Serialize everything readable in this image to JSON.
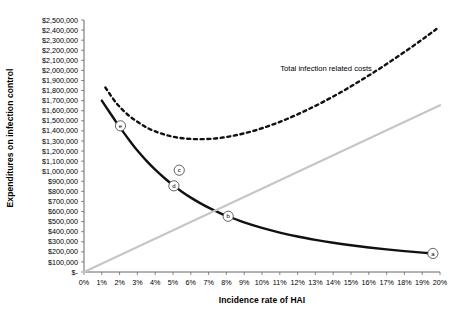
{
  "chart_data": {
    "type": "line",
    "title": "",
    "xlabel": "Incidence rate of HAI",
    "ylabel": "Expenditures on infection control",
    "xlim": [
      0,
      20
    ],
    "ylim": [
      0,
      2500000
    ],
    "grid": false,
    "legend_position": "inline-annotation",
    "x_tick_labels": [
      "0%",
      "1%",
      "2%",
      "3%",
      "4%",
      "5%",
      "6%",
      "7%",
      "8%",
      "9%",
      "10%",
      "11%",
      "12%",
      "13%",
      "14%",
      "15%",
      "16%",
      "17%",
      "18%",
      "19%",
      "20%"
    ],
    "x_tick_values": [
      0,
      1,
      2,
      3,
      4,
      5,
      6,
      7,
      8,
      9,
      10,
      11,
      12,
      13,
      14,
      15,
      16,
      17,
      18,
      19,
      20
    ],
    "y_tick_labels": [
      "$2,500,000",
      "$2,400,000",
      "$2,300,000",
      "$2,200,000",
      "$2,100,000",
      "$2,000,000",
      "$1,900,000",
      "$1,800,000",
      "$1,700,000",
      "$1,600,000",
      "$1,500,000",
      "$1,400,000",
      "$1,300,000",
      "$1,200,000",
      "$1,100,000",
      "$1,000,000",
      "$900,000",
      "$800,000",
      "$700,000",
      "$600,000",
      "$500,000",
      "$400,000",
      "$300,000",
      "$200,000",
      "$100,000",
      "$-"
    ],
    "y_tick_values": [
      2500000,
      2400000,
      2300000,
      2200000,
      2100000,
      2000000,
      1900000,
      1800000,
      1700000,
      1600000,
      1500000,
      1400000,
      1300000,
      1200000,
      1100000,
      1000000,
      900000,
      800000,
      700000,
      600000,
      500000,
      400000,
      300000,
      200000,
      100000,
      0
    ],
    "annotations": [
      {
        "text": "Total infection related costs",
        "x": 13.6,
        "y": 1990000
      }
    ],
    "series": [
      {
        "name": "Infection control expenditures",
        "style": "solid",
        "color": "#111111",
        "width": 2.4,
        "x": [
          1.0,
          1.4,
          1.8,
          2.2,
          2.6,
          3.0,
          3.5,
          4.0,
          4.5,
          5.0,
          5.5,
          6.0,
          6.5,
          7.0,
          7.5,
          8.0,
          9.0,
          10.0,
          11.0,
          12.0,
          13.0,
          14.0,
          15.0,
          16.0,
          17.0,
          18.0,
          19.0,
          19.6
        ],
        "y": [
          1700000,
          1595000,
          1490000,
          1390000,
          1295000,
          1205000,
          1105000,
          1015000,
          935000,
          862000,
          797000,
          738000,
          686000,
          638000,
          596000,
          558000,
          492000,
          437000,
          391000,
          352000,
          319000,
          290000,
          265000,
          243000,
          224000,
          207000,
          192000,
          184000
        ]
      },
      {
        "name": "Total infection related costs",
        "style": "dashed",
        "color": "#111111",
        "width": 2.4,
        "x": [
          1.2,
          1.8,
          2.4,
          3.0,
          3.6,
          4.2,
          4.8,
          5.4,
          6.0,
          6.6,
          7.2,
          7.8,
          8.4,
          9.0,
          9.6,
          10.2,
          10.8,
          11.4,
          12.0,
          12.6,
          13.2,
          13.8,
          14.4,
          15.0,
          15.6,
          16.2,
          16.8,
          17.4,
          18.0,
          18.6,
          19.2,
          19.8
        ],
        "y": [
          1830000,
          1680000,
          1570000,
          1490000,
          1426000,
          1382000,
          1350000,
          1330000,
          1320000,
          1318000,
          1322000,
          1334000,
          1352000,
          1376000,
          1404000,
          1438000,
          1476000,
          1518000,
          1564000,
          1614000,
          1666000,
          1722000,
          1780000,
          1842000,
          1906000,
          1972000,
          2040000,
          2110000,
          2182000,
          2256000,
          2332000,
          2410000
        ]
      },
      {
        "name": "Infection cost line",
        "style": "solid",
        "color": "#c6c6c6",
        "width": 2.2,
        "x": [
          0,
          20
        ],
        "y": [
          0,
          1655000
        ]
      }
    ],
    "point_markers": [
      {
        "label": "a",
        "x": 19.6,
        "y": 184000
      },
      {
        "label": "b",
        "x": 8.1,
        "y": 553000
      },
      {
        "label": "c",
        "x": 5.35,
        "y": 1010000
      },
      {
        "label": "d",
        "x": 5.05,
        "y": 855000
      },
      {
        "label": "e",
        "x": 2.05,
        "y": 1450000
      }
    ]
  }
}
